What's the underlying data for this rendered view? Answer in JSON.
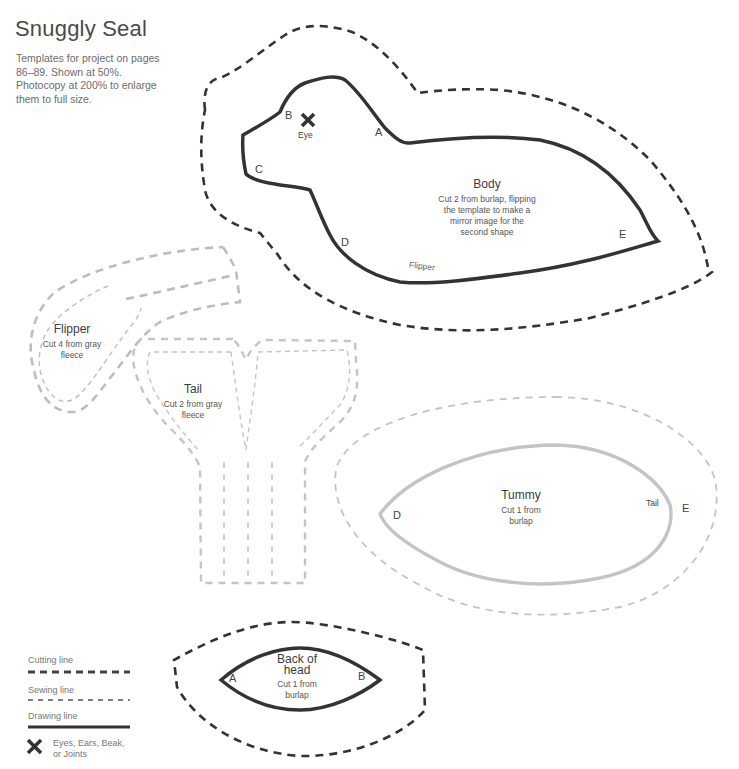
{
  "header": {
    "title": "Snuggly Seal",
    "subtitle": "Templates for project on pages 86–89. Shown at 50%. Photocopy at 200% to enlarge them to full size."
  },
  "colors": {
    "dark_line": "#333333",
    "gray_line": "#bdbdbd",
    "text": "#555555"
  },
  "pieces": {
    "body": {
      "name": "Body",
      "instructions": "Cut 2 from burlap, flipping the template to make a mirror image for the second shape",
      "marks": [
        "A",
        "B",
        "C",
        "D",
        "E"
      ],
      "eye_label": "Eye",
      "flipper_note": "Flipper"
    },
    "flipper": {
      "name": "Flipper",
      "instructions": "Cut 4 from gray fleece"
    },
    "tail": {
      "name": "Tail",
      "instructions": "Cut 2 from gray fleece"
    },
    "tummy": {
      "name": "Tummy",
      "instructions": "Cut 1 from burlap",
      "marks": [
        "D",
        "E"
      ],
      "tail_note": "Tail"
    },
    "back_of_head": {
      "name": "Back of head",
      "instructions": "Cut 1 from burlap",
      "marks": [
        "A",
        "B"
      ]
    }
  },
  "legend": {
    "items": [
      {
        "label": "Cutting line",
        "icon": "thick-dashed-line"
      },
      {
        "label": "Sewing line",
        "icon": "thin-dashed-line"
      },
      {
        "label": "Drawing line",
        "icon": "solid-line"
      },
      {
        "label": "Eyes, Ears, Beak, or Joints",
        "icon": "x-mark-icon"
      }
    ]
  }
}
